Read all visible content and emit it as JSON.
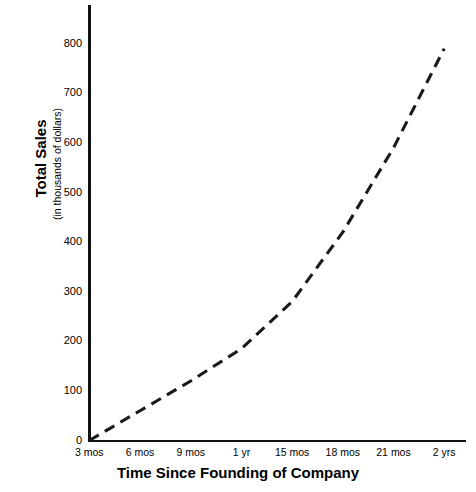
{
  "chart_data": {
    "type": "line",
    "title": "",
    "xlabel": "Time Since Founding of Company",
    "ylabel": "Total Sales",
    "ylabel_sub": "(in thousands of dollars)",
    "categories": [
      "3 mos",
      "6 mos",
      "9 mos",
      "1 yr",
      "15 mos",
      "18 mos",
      "21 mos",
      "2 yrs"
    ],
    "values": [
      0,
      60,
      120,
      185,
      280,
      420,
      590,
      790
    ],
    "ytick_labels": [
      "0",
      "100",
      "200",
      "300",
      "400",
      "500",
      "600",
      "700",
      "800"
    ],
    "ytick_values": [
      0,
      100,
      200,
      300,
      400,
      500,
      600,
      700,
      800
    ],
    "ylim": [
      0,
      870
    ],
    "xlim": [
      0,
      8
    ],
    "grid": false,
    "legend": false,
    "line_style": "dashed",
    "line_color": "#1a1a1a",
    "axis_color": "#111111",
    "background": "#ffffff"
  },
  "footnote": "",
  "icons": {
    "axis_y": "vertical-axis",
    "axis_x": "horizontal-axis"
  }
}
